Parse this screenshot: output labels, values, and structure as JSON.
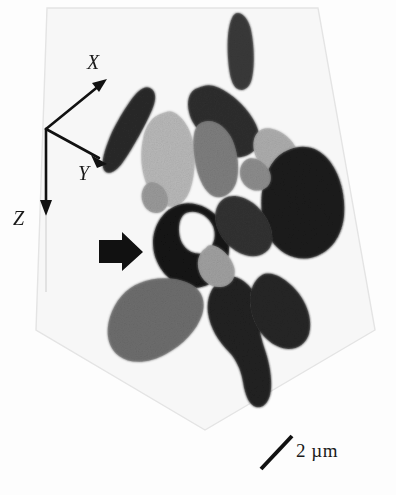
{
  "figure": {
    "kind": "grayscale-3d-tomographic-reconstruction",
    "background_color": "#fdfdfd",
    "width": 396,
    "height": 495
  },
  "axes": {
    "name": "coordinate-triad",
    "origin": {
      "x": 46,
      "y": 129
    },
    "x_label": "X",
    "y_label": "Y",
    "z_label": "Z",
    "color": "#111111",
    "arrows": [
      {
        "label": "X",
        "tip_x": 106,
        "tip_y": 80
      },
      {
        "label": "Y",
        "tip_x": 104,
        "tip_y": 162
      },
      {
        "label": "Z",
        "tip_x": 46,
        "tip_y": 214
      }
    ]
  },
  "pointer": {
    "name": "annotation-arrow",
    "direction": "right",
    "color": "#111111",
    "tip_x": 141,
    "tip_y": 253
  },
  "scalebar": {
    "label": "2 µm",
    "length_value": 2,
    "length_unit": "µm",
    "color": "#111111",
    "x1": 261,
    "y1": 469,
    "x2": 292,
    "y2": 436
  },
  "bounding_box": {
    "name": "volume-outline",
    "stroke": "#e4e4e4",
    "fill": "#f7f7f7",
    "points": "47,8 318,8 375,330 205,430 36,330"
  },
  "palette": {
    "near_black": "#1b1b1b",
    "very_dark": "#262626",
    "dark": "#343434",
    "dark_gray": "#4a4a4a",
    "mid_dark_gray": "#5c5c5c",
    "mid_gray": "#707070",
    "gray": "#878787",
    "light_gray": "#a8a8a8",
    "lighter_gray": "#bdbdbd",
    "pale_gray": "#cfcfcf"
  },
  "particles": [
    {
      "id": "particle-top-rod",
      "description": "isolated vertical elongated rod, upper right",
      "gray": "#3a3a3a",
      "path": "M232,18 C228,26 227,42 228,58 C229,72 231,83 236,88 C243,93 250,88 252,78 C255,64 254,44 251,30 C249,20 243,13 238,13 C235,13 233,15 232,18 Z"
    },
    {
      "id": "particle-left-needle",
      "description": "elongated diagonal needle, upper left",
      "gray": "#2a2a2a",
      "path": "M150,88 C145,85 138,90 131,100 C122,113 113,128 108,142 C103,155 101,165 104,170 C108,176 116,172 123,162 C133,148 145,126 152,110 C157,98 156,91 150,88 Z"
    },
    {
      "id": "particle-upper-mid-dark",
      "description": "angular dark chunk upper middle",
      "gray": "#2f2f2f",
      "path": "M198,88 C190,90 186,100 189,112 C191,122 198,130 205,138 C213,147 222,155 232,157 C243,159 254,154 258,145 C262,136 257,124 249,113 C240,101 227,90 214,86 C208,84 202,86 198,88 Z"
    },
    {
      "id": "particle-light-blob",
      "description": "pale gray rounded blob, middle left",
      "gray": "#b8b8b8",
      "path": "M163,113 C152,116 145,126 143,139 C140,153 141,168 145,180 C149,193 157,203 166,206 C176,209 186,202 190,190 C195,176 196,158 193,142 C190,127 182,116 173,112 C169,110 166,112 163,113 Z"
    },
    {
      "id": "particle-mid-gray-wedge",
      "description": "medium gray wedge right of pale blob",
      "gray": "#7e7e7e",
      "path": "M196,128 C192,136 193,152 196,166 C199,180 205,192 213,196 C222,200 232,194 236,183 C240,170 238,152 232,139 C226,127 216,120 207,121 C201,122 198,124 196,128 Z"
    },
    {
      "id": "particle-upper-right-light",
      "description": "light gray sliver upper right",
      "gray": "#adadad",
      "path": "M258,132 C252,138 252,150 257,159 C262,168 272,174 282,173 C293,172 300,164 298,154 C296,144 287,134 276,130 C268,127 262,128 258,132 Z"
    },
    {
      "id": "particle-large-black-right",
      "description": "large near-black mass, right side",
      "gray": "#1d1d1d",
      "path": "M288,150 C275,155 266,169 263,186 C259,205 262,226 271,240 C281,255 298,262 314,257 C331,252 342,236 344,216 C346,194 339,170 326,157 C314,145 300,145 288,150 Z"
    },
    {
      "id": "particle-center-black",
      "description": "very black lobed particle at center, marked by arrow",
      "gray": "#151515",
      "path": "M175,206 C162,212 153,227 153,243 C153,261 164,278 180,285 C196,292 214,286 223,272 C232,257 231,235 220,220 C210,206 190,199 175,206 Z M186,213 C196,209 208,215 213,226 C217,236 214,247 205,252 C197,256 187,252 182,243 C177,233 178,217 186,213 Z"
    },
    {
      "id": "particle-center-connector",
      "description": "dark connecting lobe right of center black",
      "gray": "#333333",
      "path": "M225,198 C216,203 213,215 217,227 C221,240 232,251 245,255 C258,259 270,253 272,242 C274,229 266,213 253,203 C243,196 232,194 225,198 Z"
    },
    {
      "id": "particle-bottom-left-gray",
      "description": "medium gray broad chunk, lower left",
      "gray": "#6e6e6e",
      "path": "M140,283 C126,288 115,301 110,317 C105,333 108,348 119,356 C131,365 150,363 166,354 C183,345 197,330 202,315 C207,299 200,287 186,282 C170,276 152,278 140,283 Z"
    },
    {
      "id": "particle-bottom-center-dark",
      "description": "dark angular mass lower center, extends downward",
      "gray": "#232323",
      "path": "M224,278 C212,284 206,298 208,313 C210,328 219,342 229,352 C236,359 241,370 243,382 C245,395 249,405 256,407 C264,409 270,401 271,389 C272,376 269,362 265,350 C261,338 258,326 259,314 C260,300 253,287 242,280 C236,276 229,275 224,278 Z"
    },
    {
      "id": "particle-bottom-right-dark",
      "description": "dark mass lower right of bottom cluster",
      "gray": "#282828",
      "path": "M262,275 C252,281 248,295 251,310 C254,326 264,340 277,346 C291,353 305,347 309,334 C313,320 307,302 295,289 C285,278 271,270 262,275 Z"
    },
    {
      "id": "particle-mid-light-sliver",
      "description": "light gray sliver between center and bottom",
      "gray": "#a0a0a0",
      "path": "M206,248 C199,252 196,262 199,271 C202,281 211,288 221,287 C231,286 237,277 234,267 C231,256 220,246 211,245 C209,245 207,246 206,248 Z"
    },
    {
      "id": "particle-upper-left-small",
      "description": "small gray fragment below light blob",
      "gray": "#9a9a9a",
      "path": "M148,183 C142,187 140,196 143,203 C146,211 154,215 161,212 C168,209 170,200 166,192 C162,184 153,180 148,183 Z"
    },
    {
      "id": "particle-right-small-gray",
      "description": "small gray fragment at right edge of cluster",
      "gray": "#8d8d8d",
      "path": "M246,160 C240,164 238,173 242,181 C246,189 256,193 264,189 C272,185 273,175 267,167 C261,159 251,156 246,160 Z"
    }
  ]
}
